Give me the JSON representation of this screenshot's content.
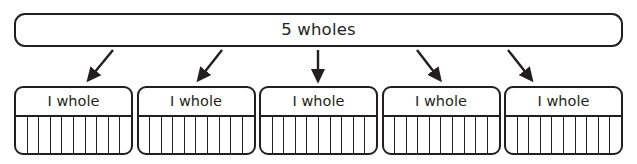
{
  "diagram": {
    "type": "fraction-bar-model",
    "whole_bar": {
      "label": "5 wholes"
    },
    "arrows": {
      "count": 5,
      "icon": "arrow-down-icon",
      "color": "#231f20",
      "segments": [
        {
          "x1": 113,
          "y1": 50,
          "x2": 88,
          "y2": 80,
          "direction": "down-left"
        },
        {
          "x1": 222,
          "y1": 50,
          "x2": 198,
          "y2": 80,
          "direction": "down-left"
        },
        {
          "x1": 318,
          "y1": 50,
          "x2": 318,
          "y2": 80,
          "direction": "down"
        },
        {
          "x1": 417,
          "y1": 50,
          "x2": 440,
          "y2": 80,
          "direction": "down-right"
        },
        {
          "x1": 508,
          "y1": 50,
          "x2": 532,
          "y2": 80,
          "direction": "down-right"
        }
      ]
    },
    "units": [
      {
        "label": "I whole",
        "cells": 10
      },
      {
        "label": "I whole",
        "cells": 10
      },
      {
        "label": "I whole",
        "cells": 10
      },
      {
        "label": "I whole",
        "cells": 10
      },
      {
        "label": "I whole",
        "cells": 10
      }
    ],
    "colors": {
      "stroke": "#231f20",
      "background": "#ffffff",
      "text": "#231f20"
    }
  }
}
